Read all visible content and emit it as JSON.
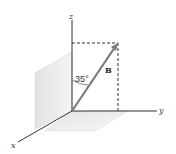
{
  "diagram": {
    "axes": {
      "x": "x",
      "y": "y",
      "z": "z"
    },
    "vector": {
      "label": "B",
      "color": "#7a7a7a"
    },
    "angle": {
      "label": "35°",
      "degrees": 35,
      "from_axis": "z"
    },
    "planes": {
      "fill": "#e6e6e6"
    }
  }
}
